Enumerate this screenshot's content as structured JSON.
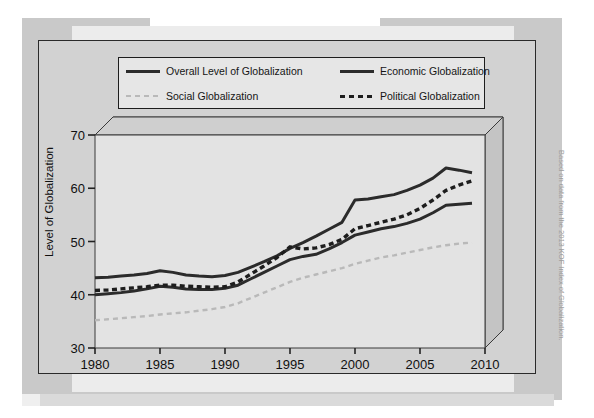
{
  "figure": {
    "credit": "Based on data from the 2013 KOF Index of Globalization."
  },
  "legend": {
    "entries": [
      {
        "label": "Overall Level of Globalization",
        "style": "solid-dark",
        "color": "#2b2b2b"
      },
      {
        "label": "Economic Globalization",
        "style": "solid-dark",
        "color": "#2b2b2b"
      },
      {
        "label": "Social Globalization",
        "style": "dash-light",
        "color": "#b9b9b9"
      },
      {
        "label": "Political Globalization",
        "style": "dash-dark",
        "color": "#1d1d1d"
      }
    ]
  },
  "chart_data": {
    "type": "line",
    "title": "",
    "xlabel": "",
    "ylabel": "Level of Globalization",
    "xlim": [
      1980,
      2010
    ],
    "ylim": [
      30,
      70
    ],
    "xticks": [
      1980,
      1985,
      1990,
      1995,
      2000,
      2005,
      2010
    ],
    "yticks": [
      30,
      40,
      50,
      60,
      70
    ],
    "grid": false,
    "legend_position": "top",
    "x": [
      1980,
      1981,
      1982,
      1983,
      1984,
      1985,
      1986,
      1987,
      1988,
      1989,
      1990,
      1991,
      1992,
      1993,
      1994,
      1995,
      1996,
      1997,
      1998,
      1999,
      2000,
      2001,
      2002,
      2003,
      2004,
      2005,
      2006,
      2007,
      2008,
      2009
    ],
    "series": [
      {
        "name": "Overall Level of Globalization",
        "color": "#2b2b2b",
        "style": "solid",
        "values": [
          43.2,
          43.3,
          43.5,
          43.7,
          44.0,
          44.5,
          44.2,
          43.7,
          43.5,
          43.4,
          43.6,
          44.2,
          45.2,
          46.2,
          47.3,
          48.7,
          49.8,
          51.0,
          52.3,
          53.6,
          57.8,
          58.0,
          58.4,
          58.8,
          59.6,
          60.6,
          61.9,
          63.8,
          63.4,
          62.9
        ]
      },
      {
        "name": "Economic Globalization",
        "color": "#2b2b2b",
        "style": "solid",
        "values": [
          40.0,
          40.2,
          40.4,
          40.7,
          41.1,
          41.6,
          41.4,
          41.1,
          41.0,
          41.0,
          41.2,
          41.8,
          43.0,
          44.2,
          45.4,
          46.6,
          47.2,
          47.6,
          48.6,
          49.8,
          51.2,
          51.8,
          52.4,
          52.8,
          53.4,
          54.2,
          55.4,
          56.8,
          57.0,
          57.2
        ]
      },
      {
        "name": "Social Globalization",
        "color": "#b9b9b9",
        "style": "dashed-light",
        "values": [
          35.2,
          35.4,
          35.6,
          35.8,
          36.0,
          36.3,
          36.5,
          36.7,
          37.0,
          37.3,
          37.7,
          38.4,
          39.4,
          40.4,
          41.4,
          42.4,
          43.2,
          43.8,
          44.4,
          45.0,
          45.8,
          46.4,
          47.0,
          47.4,
          47.9,
          48.4,
          48.9,
          49.3,
          49.6,
          49.8
        ]
      },
      {
        "name": "Political Globalization",
        "color": "#1d1d1d",
        "style": "dashed-dark",
        "values": [
          40.8,
          40.9,
          41.1,
          41.3,
          41.5,
          41.8,
          41.8,
          41.6,
          41.5,
          41.4,
          41.5,
          42.4,
          43.9,
          45.4,
          47.0,
          49.0,
          48.6,
          48.8,
          49.4,
          50.4,
          52.4,
          53.0,
          53.6,
          54.2,
          55.0,
          56.2,
          57.8,
          59.6,
          60.6,
          61.4
        ]
      }
    ]
  }
}
